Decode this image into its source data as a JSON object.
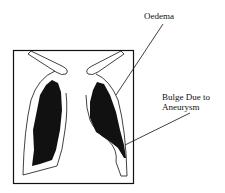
{
  "diagram": {
    "labels": {
      "oedema": "Oedema",
      "bulge_line1": "Bulge Due to",
      "bulge_line2": "Aneurysm"
    },
    "colors": {
      "ink": "#111111",
      "background": "#ffffff"
    }
  }
}
